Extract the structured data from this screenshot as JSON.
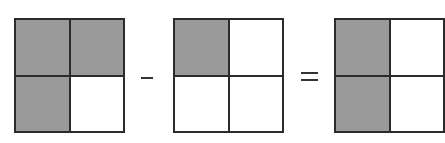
{
  "diagram": {
    "type": "fraction-subtraction-area-model",
    "description": "3/4 - 1/4 = 2/4",
    "colors": {
      "shaded": "#9a9a9a",
      "unshaded": "#ffffff",
      "border": "#2b2b2b",
      "operator": "#333333"
    },
    "operands": [
      {
        "id": "grid-a",
        "rows": 2,
        "cols": 2,
        "cells": [
          true,
          true,
          true,
          false
        ],
        "shaded_count": 3,
        "total": 4
      },
      {
        "id": "grid-b",
        "rows": 2,
        "cols": 2,
        "cells": [
          true,
          false,
          false,
          false
        ],
        "shaded_count": 1,
        "total": 4
      }
    ],
    "result": {
      "id": "grid-c",
      "rows": 2,
      "cols": 2,
      "cells": [
        true,
        false,
        true,
        false
      ],
      "shaded_count": 2,
      "total": 4
    },
    "operators": [
      "minus",
      "equals"
    ]
  }
}
